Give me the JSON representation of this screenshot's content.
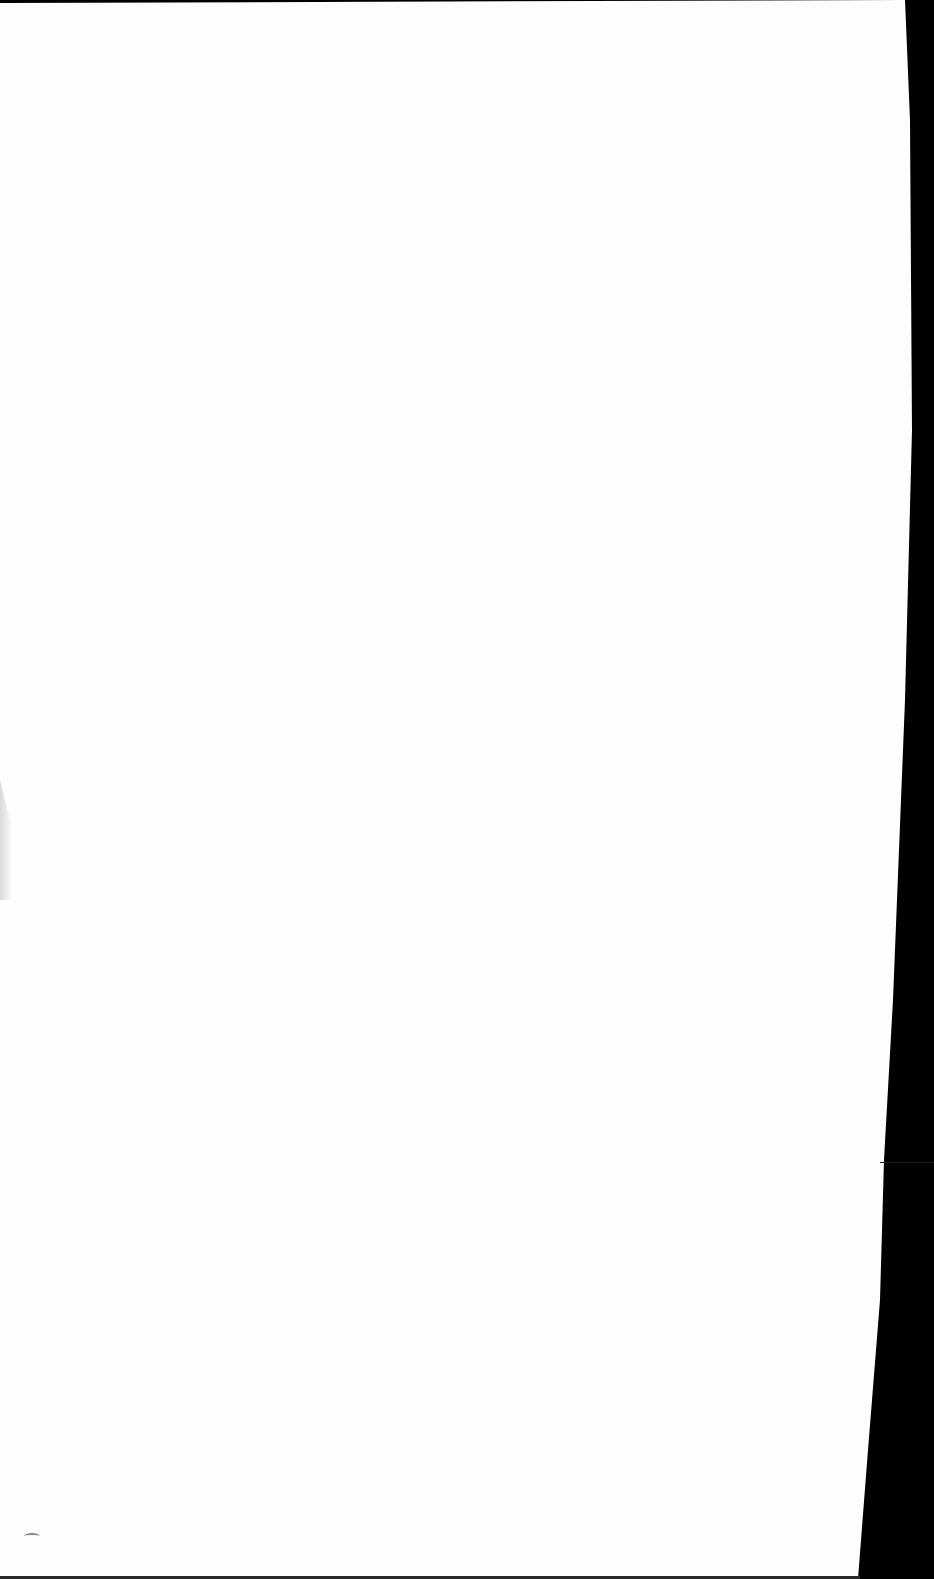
{
  "document": {
    "type": "blank-page",
    "content": "",
    "colors": {
      "paper": "#fdfdfd",
      "background": "#000000"
    }
  }
}
